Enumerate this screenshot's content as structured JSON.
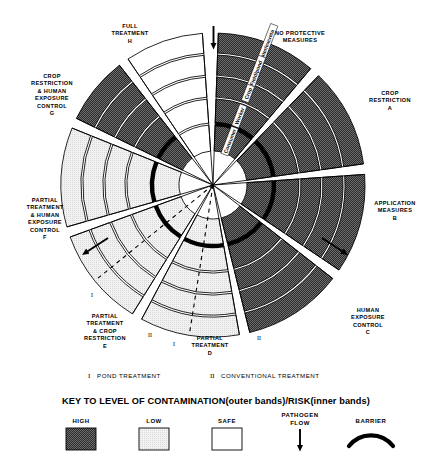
{
  "diagram": {
    "title_visible": false,
    "center": {
      "x": 213,
      "y": 185
    },
    "pathogen_flow_arrow": {
      "name": "pathogen-flow-arrow",
      "direction": "down"
    },
    "bands": [
      {
        "id": "wastewater",
        "label": "Wastewater/excreta",
        "order": 1
      },
      {
        "id": "fieldpond",
        "label": "Field/pond",
        "order": 2
      },
      {
        "id": "crop",
        "label": "Crop",
        "order": 3
      },
      {
        "id": "worker",
        "label": "Worker",
        "order": 4
      },
      {
        "id": "consumer",
        "label": "Consumer",
        "order": 5
      }
    ],
    "sectors": [
      {
        "key": "none",
        "title_lines": [
          "NO PROTECTIVE",
          "MEASURES"
        ],
        "letter": "",
        "levels": [
          "HIGH",
          "HIGH",
          "HIGH",
          "HIGH",
          "HIGH"
        ]
      },
      {
        "key": "A",
        "title_lines": [
          "CROP",
          "RESTRICTION"
        ],
        "letter": "A",
        "levels": [
          "HIGH",
          "HIGH",
          "HIGH",
          "HIGH",
          "HIGH"
        ]
      },
      {
        "key": "B",
        "title_lines": [
          "APPLICATION",
          "MEASURES"
        ],
        "letter": "B",
        "levels": [
          "HIGH",
          "HIGH",
          "HIGH",
          "HIGH",
          "HIGH"
        ]
      },
      {
        "key": "C",
        "title_lines": [
          "HUMAN",
          "EXPOSURE",
          "CONTROL"
        ],
        "letter": "C",
        "levels": [
          "HIGH",
          "HIGH",
          "HIGH",
          "HIGH",
          "HIGH"
        ]
      },
      {
        "key": "D",
        "title_lines": [
          "PARTIAL",
          "TREATMENT"
        ],
        "letter": "D",
        "levels": [
          "LOW",
          "LOW",
          "LOW",
          "LOW",
          "LOW"
        ]
      },
      {
        "key": "E",
        "title_lines": [
          "PARTIAL",
          "TREATMENT",
          "& CROP",
          "RESTRICTION"
        ],
        "letter": "E",
        "levels": [
          "LOW",
          "LOW",
          "LOW",
          "LOW",
          "LOW"
        ]
      },
      {
        "key": "F",
        "title_lines": [
          "PARTIAL",
          "TREATMENT",
          "& HUMAN",
          "EXPOSURE",
          "CONTROL"
        ],
        "letter": "F",
        "levels": [
          "LOW",
          "LOW",
          "LOW",
          "LOW",
          "LOW"
        ]
      },
      {
        "key": "G",
        "title_lines": [
          "CROP",
          "RESTRICTION",
          "& HUMAN",
          "EXPOSURE",
          "CONTROL"
        ],
        "letter": "G",
        "levels": [
          "HIGH",
          "HIGH",
          "HIGH",
          "HIGH",
          "HIGH"
        ]
      },
      {
        "key": "H",
        "title_lines": [
          "FULL",
          "TREATMENT"
        ],
        "letter": "H",
        "levels": [
          "SAFE",
          "SAFE",
          "SAFE",
          "SAFE",
          "SAFE"
        ]
      }
    ],
    "treatment_markers": [
      {
        "roman": "I",
        "sector": "F"
      },
      {
        "roman": "II",
        "sector": "E"
      },
      {
        "roman": "I",
        "sector": "D-left"
      },
      {
        "roman": "II",
        "sector": "D-right"
      }
    ]
  },
  "footnote": {
    "items": [
      {
        "roman": "I",
        "text": "POND TREATMENT"
      },
      {
        "roman": "II",
        "text": "CONVENTIONAL TREATMENT"
      }
    ]
  },
  "key": {
    "title": "KEY TO LEVEL OF CONTAMINATION(outer bands)/RISK(inner bands)",
    "entries": [
      {
        "label": "HIGH",
        "swatch": "high-checker",
        "color": "#3a3a3a"
      },
      {
        "label": "LOW",
        "swatch": "low-light",
        "color": "#ededed"
      },
      {
        "label": "SAFE",
        "swatch": "safe-white",
        "color": "#ffffff"
      },
      {
        "label_lines": [
          "PATHOGEN",
          "FLOW"
        ],
        "swatch": "down-arrow-icon",
        "color": "#000000"
      },
      {
        "label": "BARRIER",
        "swatch": "barrier-arc-icon",
        "color": "#000000"
      }
    ]
  },
  "colors": {
    "high": "#3a3a3a",
    "low": "#ebebeb",
    "safe": "#ffffff",
    "line": "#000000",
    "barrier": "#000000"
  }
}
